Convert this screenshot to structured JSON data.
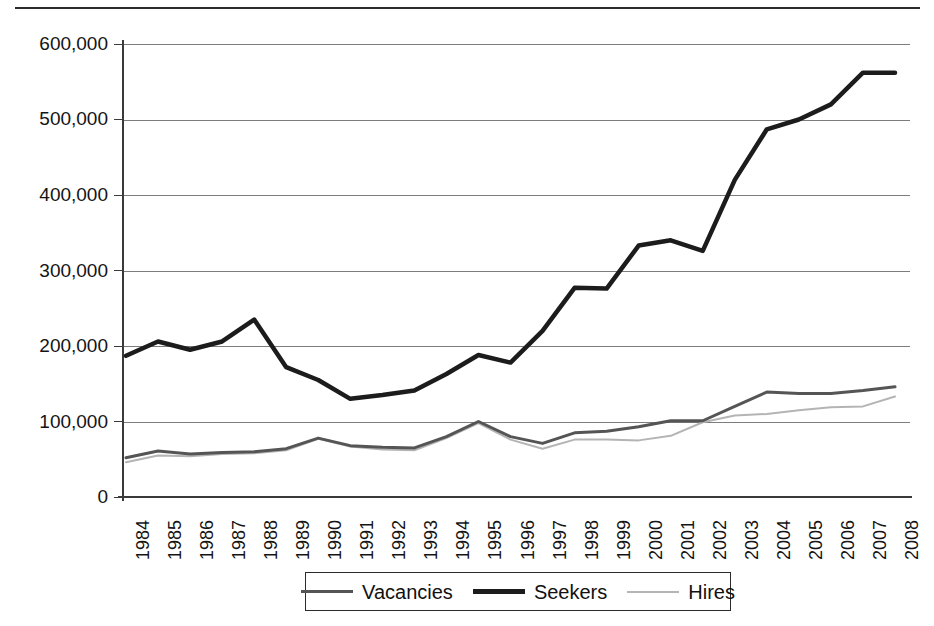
{
  "chart_data": {
    "type": "line",
    "title": "",
    "subtitle": "",
    "xlabel": "",
    "ylabel": "",
    "grid": true,
    "legend_position": "bottom",
    "ylim": [
      0,
      600000
    ],
    "ytick_values": [
      0,
      100000,
      200000,
      300000,
      400000,
      500000,
      600000
    ],
    "ytick_labels": [
      "0",
      "100,000",
      "200,000",
      "300,000",
      "400,000",
      "500,000",
      "600,000"
    ],
    "categories": [
      "1984",
      "1985",
      "1986",
      "1987",
      "1988",
      "1989",
      "1990",
      "1991",
      "1992",
      "1993",
      "1994",
      "1995",
      "1996",
      "1997",
      "1998",
      "1999",
      "2000",
      "2001",
      "2002",
      "2003",
      "2004",
      "2005",
      "2006",
      "2007",
      "2008"
    ],
    "series": [
      {
        "name": "Vacancies",
        "color": "#555555",
        "line_width": 3,
        "values": [
          52000,
          61000,
          57000,
          59000,
          60000,
          64000,
          78000,
          68000,
          66000,
          65000,
          80000,
          100000,
          80000,
          71000,
          85000,
          87000,
          93000,
          101000,
          101000,
          120000,
          139000,
          137000,
          137000,
          141000,
          146000
        ]
      },
      {
        "name": "Seekers",
        "color": "#1c1c1c",
        "line_width": 5,
        "values": [
          187000,
          206000,
          195000,
          206000,
          235000,
          172000,
          155000,
          130000,
          135000,
          141000,
          163000,
          188000,
          178000,
          220000,
          277000,
          276000,
          333000,
          340000,
          326000,
          420000,
          487000,
          500000,
          520000,
          562000,
          562000
        ]
      },
      {
        "name": "Hires",
        "color": "#b4b4b4",
        "line_width": 2,
        "values": [
          46000,
          55000,
          54000,
          57000,
          58000,
          62000,
          77000,
          67000,
          63000,
          62000,
          78000,
          98000,
          76000,
          64000,
          76000,
          76000,
          75000,
          81000,
          99000,
          108000,
          110000,
          115000,
          119000,
          120000,
          133000
        ]
      }
    ]
  },
  "legend": {
    "items": [
      {
        "label": "Vacancies",
        "swatch": "line-swatch-vacancies"
      },
      {
        "label": "Seekers",
        "swatch": "line-swatch-seekers"
      },
      {
        "label": "Hires",
        "swatch": "line-swatch-hires"
      }
    ]
  },
  "colors": {
    "vacancies": "#555555",
    "seekers": "#1c1c1c",
    "hires": "#b4b4b4",
    "grid": "#7d7d7d",
    "axis": "#3a3a3a",
    "text": "#141414",
    "background": "#ffffff"
  }
}
